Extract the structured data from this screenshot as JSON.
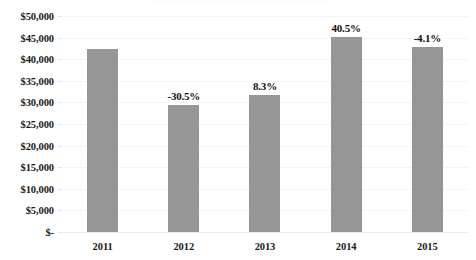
{
  "chart_data": {
    "type": "bar",
    "title": "",
    "xlabel": "",
    "ylabel": "",
    "categories": [
      "2011",
      "2012",
      "2013",
      "2014",
      "2015"
    ],
    "values": [
      42300,
      29400,
      31800,
      45100,
      42800
    ],
    "data_labels": [
      "",
      "-30.5%",
      "8.3%",
      "40.5%",
      "-4.1%"
    ],
    "ylim": [
      0,
      50000
    ],
    "ytick_labels": [
      "$50,000",
      "$45,000",
      "$40,000",
      "$35,000",
      "$30,000",
      "$25,000",
      "$20,000",
      "$15,000",
      "$10,000",
      "$5,000",
      "$-"
    ],
    "ytick_values": [
      50000,
      45000,
      40000,
      35000,
      30000,
      25000,
      20000,
      15000,
      10000,
      5000,
      0
    ],
    "grid": true,
    "legend": false,
    "legend_position": "none",
    "colors": {
      "bar_fill": "#969696",
      "gridline": "#f4f4f4",
      "baseline": "#ededed",
      "text": "#1a1a1a",
      "background": "#ffffff"
    }
  }
}
